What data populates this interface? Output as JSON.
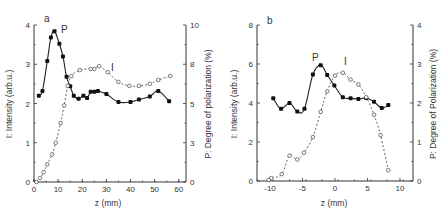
{
  "chart_data": [
    {
      "type": "line",
      "panel_label": "a",
      "xlabel": "z (mm)",
      "ylabel": "I:  Intensity (arb.u.)",
      "ylabel_right": "P:  Degree of polarization (%)",
      "xlim": [
        0,
        63
      ],
      "ylim": [
        0,
        4
      ],
      "ylim_right": [
        0,
        10
      ],
      "xticks": [
        "0",
        "10",
        "20",
        "30",
        "40",
        "50",
        "60"
      ],
      "yticks": [
        "0",
        "1",
        "2",
        "3",
        "4"
      ],
      "yticks_right": [
        "0",
        "3",
        "5",
        "8",
        "10"
      ],
      "grid": false,
      "series": [
        {
          "name": "P",
          "axis": "right",
          "marker": "filled-circle",
          "line": "solid",
          "x": [
            2,
            3.5,
            5.5,
            7,
            8.5,
            10.5,
            12,
            13.5,
            15,
            16.5,
            18.5,
            20.5,
            22,
            23.5,
            25,
            26.5,
            30,
            35,
            40,
            43.5,
            48,
            51.5,
            56
          ],
          "values": [
            5.5,
            5.8,
            7.7,
            9.2,
            9.6,
            8.8,
            8.0,
            6.7,
            6.1,
            5.5,
            5.3,
            5.5,
            5.35,
            5.75,
            5.75,
            5.8,
            5.6,
            5.1,
            5.1,
            5.25,
            5.45,
            5.8,
            5.15
          ]
        },
        {
          "name": "I",
          "axis": "left",
          "marker": "open-circle",
          "line": "dashed",
          "x": [
            1,
            2.5,
            4,
            5.5,
            7.5,
            9,
            11,
            12.5,
            14,
            15.5,
            19,
            23.5,
            25,
            27,
            30.5,
            35,
            39.5,
            43.5,
            48,
            51.5,
            56.5
          ],
          "values": [
            0.0,
            0.1,
            0.25,
            0.45,
            0.7,
            1.0,
            1.5,
            1.95,
            2.45,
            2.7,
            2.85,
            2.88,
            2.88,
            2.95,
            2.8,
            2.55,
            2.45,
            2.45,
            2.5,
            2.6,
            2.7
          ]
        }
      ],
      "annotations": [
        "a",
        "P",
        "I"
      ]
    },
    {
      "type": "line",
      "panel_label": "b",
      "xlabel": "z (mm)",
      "ylabel": "I:  Intensity (arb.u.)",
      "ylabel_right": "P:  Degree of Polarization (%)",
      "xlim": [
        -12,
        12
      ],
      "ylim": [
        0,
        8
      ],
      "ylim_right": [
        0,
        4
      ],
      "xticks": [
        "-10",
        "-5",
        "0",
        "5",
        "10"
      ],
      "yticks": [
        "0",
        "2",
        "4",
        "6",
        "8"
      ],
      "yticks_right": [
        "0",
        "1",
        "2",
        "3",
        "4"
      ],
      "grid": false,
      "series": [
        {
          "name": "P",
          "axis": "right",
          "marker": "filled-circle",
          "line": "solid",
          "x": [
            -9.5,
            -8.3,
            -7,
            -5.8,
            -4.7,
            -3.4,
            -2.2,
            -1.2,
            -0.1,
            1.2,
            2.4,
            3.6,
            4.8,
            6,
            7.2,
            8.2
          ],
          "values": [
            2.12,
            1.85,
            2.0,
            1.78,
            1.85,
            2.73,
            2.97,
            2.72,
            2.45,
            2.15,
            2.12,
            2.1,
            2.13,
            2.03,
            1.87,
            1.95
          ]
        },
        {
          "name": "I",
          "axis": "left",
          "marker": "open-circle",
          "line": "dashed",
          "x": [
            -10.2,
            -9.8,
            -8.2,
            -7,
            -5.8,
            -4.8,
            -3.4,
            -2.2,
            -1.2,
            0,
            1.2,
            2.4,
            3.6,
            4.8,
            6,
            7,
            8.2
          ],
          "values": [
            0.05,
            0.15,
            0.35,
            1.3,
            1.1,
            1.45,
            2.25,
            3.55,
            4.6,
            5.4,
            5.55,
            5.2,
            4.95,
            4.3,
            3.4,
            2.35,
            0.55
          ]
        }
      ],
      "annotations": [
        "b",
        "P",
        "I"
      ]
    }
  ],
  "panels": {
    "a": {
      "label": "a",
      "xlabel": "z (mm)",
      "ylabel": "I:  Intensity (arb.u.)",
      "ylabel_right": "P:  Degree of polarization (%)",
      "p_label": "P",
      "i_label": "I"
    },
    "b": {
      "label": "b",
      "xlabel": "z (mm)",
      "ylabel": "I:  Intensity (arb.u.)",
      "ylabel_right": "P:  Degree of Polarization (%)",
      "p_label": "P",
      "i_label": "I"
    }
  }
}
